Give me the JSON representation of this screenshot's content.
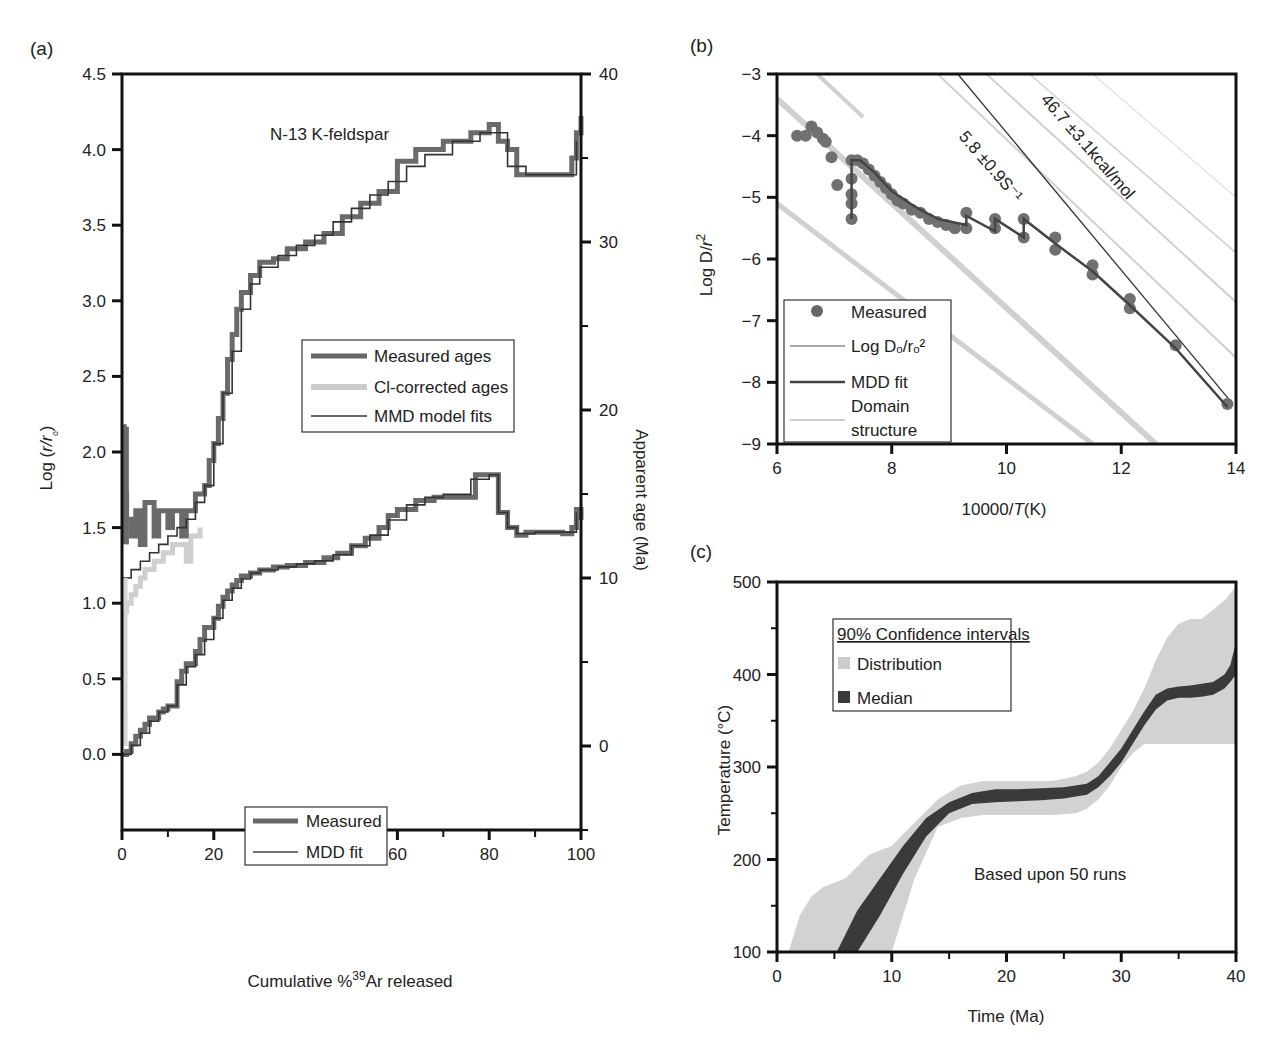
{
  "figure": {
    "panels": [
      "(a)",
      "(b)",
      "(c)"
    ]
  },
  "chart_data": [
    {
      "id": "a",
      "type": "line",
      "panel_label": "(a)",
      "title": "N-13 K-feldspar",
      "xlabel": "Cumulative %39Ar released",
      "xlabel_parts": {
        "pre": "Cumulative %",
        "sup": "39",
        "post": "Ar released"
      },
      "ylabel_left": "Log (r/rₒ)",
      "ylabel_left_parts": {
        "pre": "Log (",
        "ital": "r/r",
        "sub": "ₒ",
        "post": ")"
      },
      "ylabel_right": "Apparent age (Ma)",
      "xlim": [
        0,
        100
      ],
      "ylim_left": [
        -0.5,
        4.5
      ],
      "ylim_right": [
        -5,
        40
      ],
      "xticks": [
        "0",
        "20",
        "40",
        "60",
        "80",
        "100"
      ],
      "yticks_left": [
        "0.0",
        "0.5",
        "1.0",
        "1.5",
        "2.0",
        "2.5",
        "3.0",
        "3.5",
        "4.0",
        "4.5"
      ],
      "yticks_right": [
        "0",
        "10",
        "20",
        "30",
        "40"
      ],
      "legend_ages": [
        "Measured ages",
        "Cl-corrected ages",
        "MMD model fits"
      ],
      "legend_logr": [
        "Measured",
        "MDD fit"
      ],
      "series": [
        {
          "name": "Measured ages",
          "axis": "right",
          "style": "thick-dark",
          "x": [
            0,
            0.5,
            1,
            2,
            3,
            4,
            5,
            7,
            8,
            10,
            11,
            13,
            14,
            16,
            18,
            19,
            20,
            21,
            22,
            23,
            24,
            25,
            26,
            28,
            30,
            33,
            36,
            40,
            44,
            48,
            52,
            56,
            60,
            64,
            70,
            76,
            80,
            82,
            84,
            86,
            90,
            94,
            97,
            98,
            99,
            100
          ],
          "y": [
            19,
            15,
            13.5,
            12.5,
            14,
            12,
            14.5,
            12.5,
            14,
            13,
            14,
            12.5,
            14,
            15,
            15.5,
            17,
            18,
            19.5,
            21,
            23,
            24.5,
            26,
            27,
            28,
            28.8,
            29,
            29.6,
            30,
            30.5,
            31.5,
            32.3,
            33,
            34.8,
            35.5,
            36,
            36.5,
            37,
            36,
            35.5,
            34,
            34,
            34,
            34,
            35,
            36.5,
            37.5
          ]
        },
        {
          "name": "Cl-corrected ages",
          "axis": "right",
          "style": "thick-light",
          "x": [
            0,
            0.5,
            1,
            2,
            3,
            4,
            5,
            7,
            9,
            11,
            13,
            14,
            15,
            17
          ],
          "y": [
            2,
            8,
            8.5,
            9,
            9.5,
            10,
            10.5,
            11,
            11.5,
            12,
            12,
            11,
            12.5,
            13
          ]
        },
        {
          "name": "MMD model fits",
          "axis": "right",
          "style": "thin-dark",
          "x": [
            0,
            2,
            4,
            6,
            8,
            10,
            12,
            14,
            16,
            18,
            20,
            22,
            24,
            26,
            28,
            30,
            34,
            38,
            42,
            46,
            50,
            54,
            58,
            62,
            66,
            72,
            78,
            84,
            88,
            92,
            96,
            99
          ],
          "y": [
            10,
            10.5,
            11,
            11.5,
            12,
            12.5,
            13,
            13.5,
            14.5,
            15.5,
            18,
            21,
            23.5,
            26,
            27.5,
            28.5,
            29.2,
            29.8,
            30.4,
            31.2,
            32,
            32.8,
            33.6,
            34.5,
            35.2,
            36,
            36.5,
            34.5,
            34,
            34,
            34,
            36
          ]
        },
        {
          "name": "Measured",
          "axis": "left",
          "style": "thick-dark",
          "x": [
            0,
            1,
            2,
            3,
            4,
            5,
            6,
            8,
            9,
            10,
            12,
            13,
            14,
            16,
            17,
            18,
            20,
            21,
            22,
            23,
            24,
            25,
            26,
            28,
            30,
            33,
            36,
            40,
            44,
            47,
            50,
            53,
            56,
            58,
            60,
            64,
            68,
            72,
            77,
            80,
            82,
            84,
            86,
            88,
            92,
            96,
            98,
            99,
            100
          ],
          "y": [
            0.0,
            0.02,
            0.07,
            0.12,
            0.16,
            0.2,
            0.24,
            0.28,
            0.3,
            0.32,
            0.48,
            0.55,
            0.6,
            0.68,
            0.76,
            0.84,
            0.9,
            0.98,
            1.04,
            1.08,
            1.12,
            1.15,
            1.18,
            1.2,
            1.22,
            1.24,
            1.25,
            1.27,
            1.3,
            1.33,
            1.38,
            1.43,
            1.5,
            1.58,
            1.62,
            1.68,
            1.7,
            1.7,
            1.85,
            1.85,
            1.6,
            1.5,
            1.45,
            1.47,
            1.47,
            1.46,
            1.5,
            1.62,
            1.55
          ]
        },
        {
          "name": "MDD fit",
          "axis": "left",
          "style": "thin-dark",
          "x": [
            0,
            2,
            4,
            6,
            8,
            10,
            12,
            14,
            16,
            18,
            20,
            22,
            24,
            26,
            28,
            30,
            34,
            38,
            42,
            46,
            50,
            54,
            58,
            62,
            66,
            70,
            76,
            80,
            82,
            84,
            86,
            90,
            96,
            99
          ],
          "y": [
            0.0,
            0.06,
            0.14,
            0.22,
            0.28,
            0.32,
            0.46,
            0.58,
            0.66,
            0.76,
            0.9,
            1.02,
            1.1,
            1.16,
            1.2,
            1.22,
            1.24,
            1.26,
            1.28,
            1.32,
            1.38,
            1.45,
            1.55,
            1.65,
            1.7,
            1.72,
            1.82,
            1.85,
            1.6,
            1.5,
            1.46,
            1.47,
            1.47,
            1.6
          ]
        }
      ]
    },
    {
      "id": "b",
      "type": "scatter",
      "panel_label": "(b)",
      "xlabel": "10000/T(K)",
      "xlabel_parts": {
        "pre": "10000/",
        "ital": "T",
        "post": "(K)"
      },
      "ylabel": "Log D/r²",
      "ylabel_parts": {
        "pre": "Log D/",
        "ital": "r",
        "sup": "2"
      },
      "xlim": [
        6,
        14
      ],
      "ylim": [
        -9,
        -3
      ],
      "xticks": [
        "6",
        "8",
        "10",
        "12",
        "14"
      ],
      "yticks": [
        "−9",
        "−8",
        "−7",
        "−6",
        "−5",
        "−4",
        "−3"
      ],
      "annotations": [
        "46.7 ±3.1kcal/mol",
        "5.8 ±0.9S⁻¹"
      ],
      "legend": [
        "Measured",
        "Log Dₒ/rₒ²",
        "MDD fit",
        "Domain structure"
      ],
      "legend_domain_lines": [
        "Domain",
        "structure"
      ],
      "series": [
        {
          "name": "Measured",
          "style": "dots",
          "x": [
            6.35,
            6.5,
            6.6,
            6.7,
            6.8,
            6.85,
            6.95,
            7.05,
            7.3,
            7.3,
            7.3,
            7.3,
            7.3,
            7.4,
            7.5,
            7.6,
            7.7,
            7.8,
            7.9,
            8.0,
            8.1,
            8.2,
            8.35,
            8.5,
            8.65,
            8.8,
            8.95,
            9.1,
            9.3,
            9.3,
            9.8,
            9.8,
            10.3,
            10.3,
            10.85,
            10.85,
            11.5,
            11.5,
            12.15,
            12.15,
            12.95,
            13.85
          ],
          "y": [
            -4.0,
            -4.0,
            -3.85,
            -3.95,
            -4.05,
            -4.1,
            -4.35,
            -4.8,
            -4.4,
            -4.7,
            -4.95,
            -5.1,
            -5.35,
            -4.4,
            -4.45,
            -4.55,
            -4.65,
            -4.75,
            -4.85,
            -4.95,
            -5.05,
            -5.1,
            -5.2,
            -5.25,
            -5.35,
            -5.4,
            -5.45,
            -5.5,
            -5.25,
            -5.5,
            -5.35,
            -5.5,
            -5.35,
            -5.65,
            -5.65,
            -5.85,
            -6.1,
            -6.25,
            -6.65,
            -6.8,
            -7.4,
            -8.35
          ]
        },
        {
          "name": "MDD fit",
          "style": "thick-line",
          "x": [
            7.3,
            7.3,
            7.45,
            7.7,
            8.0,
            8.4,
            8.8,
            9.3,
            9.3,
            9.8,
            9.8,
            10.3,
            10.3,
            10.85,
            11.5,
            12.15,
            12.95,
            13.85
          ],
          "y": [
            -5.35,
            -4.4,
            -4.4,
            -4.6,
            -4.9,
            -5.15,
            -5.35,
            -5.45,
            -5.3,
            -5.55,
            -5.35,
            -5.65,
            -5.35,
            -5.75,
            -6.2,
            -6.75,
            -7.45,
            -8.4
          ]
        },
        {
          "name": "Log Do/ro2",
          "style": "thin-line",
          "x": [
            9.15,
            13.9
          ],
          "y": [
            -3.0,
            -8.3
          ]
        },
        {
          "name": "Domain structure",
          "style": "light-lines",
          "lines": [
            {
              "x": [
                6.0,
                11.5
              ],
              "y": [
                -5.1,
                -9.0
              ],
              "width": 5
            },
            {
              "x": [
                6.0,
                12.6
              ],
              "y": [
                -3.4,
                -9.0
              ],
              "width": 6
            },
            {
              "x": [
                6.7,
                7.5
              ],
              "y": [
                -3.0,
                -3.7
              ],
              "width": 4
            },
            {
              "x": [
                8.8,
                14.0
              ],
              "y": [
                -3.0,
                -7.6
              ],
              "width": 2
            },
            {
              "x": [
                9.65,
                14.0
              ],
              "y": [
                -3.0,
                -6.7
              ],
              "width": 2
            },
            {
              "x": [
                10.4,
                14.0
              ],
              "y": [
                -3.0,
                -5.9
              ],
              "width": 1.5
            },
            {
              "x": [
                11.5,
                14.0
              ],
              "y": [
                -3.0,
                -5.0
              ],
              "width": 1
            }
          ]
        }
      ]
    },
    {
      "id": "c",
      "type": "area",
      "panel_label": "(c)",
      "xlabel": "Time (Ma)",
      "ylabel": "Temperature (°C)",
      "xlim": [
        0,
        40
      ],
      "ylim": [
        100,
        500
      ],
      "xticks": [
        "0",
        "10",
        "20",
        "30",
        "40"
      ],
      "yticks": [
        "100",
        "200",
        "300",
        "400",
        "500"
      ],
      "legend_title": "90% Confidence intervals",
      "legend": [
        "Distribution",
        "Median"
      ],
      "annotation": "Based upon 50 runs",
      "series": [
        {
          "name": "Distribution",
          "x": [
            1,
            2,
            3,
            4,
            5,
            6,
            8,
            10,
            12,
            14,
            16,
            18,
            20,
            22,
            24,
            26,
            27,
            28,
            29,
            30,
            31,
            32,
            33,
            34,
            35,
            36,
            37,
            38,
            39,
            40
          ],
          "upper": [
            100,
            140,
            160,
            170,
            175,
            180,
            205,
            215,
            240,
            265,
            280,
            285,
            285,
            285,
            285,
            290,
            295,
            305,
            320,
            340,
            360,
            385,
            415,
            440,
            455,
            460,
            460,
            470,
            480,
            495
          ],
          "lower": [
            100,
            100,
            100,
            100,
            100,
            100,
            100,
            100,
            180,
            235,
            245,
            248,
            248,
            248,
            248,
            250,
            255,
            265,
            280,
            300,
            315,
            325,
            325,
            325,
            325,
            325,
            325,
            325,
            325,
            325
          ]
        },
        {
          "name": "Median",
          "x": [
            5.2,
            7,
            9,
            11,
            13,
            15,
            17,
            19,
            21,
            23,
            25,
            27,
            28,
            29,
            30,
            31,
            32,
            33,
            34,
            35,
            36,
            37,
            38,
            39,
            39.5,
            40
          ],
          "upper": [
            100,
            145,
            180,
            215,
            245,
            262,
            272,
            276,
            276,
            277,
            278,
            282,
            290,
            305,
            320,
            340,
            360,
            378,
            385,
            387,
            388,
            390,
            392,
            400,
            410,
            435
          ],
          "lower": [
            100,
            100,
            140,
            185,
            225,
            250,
            260,
            262,
            263,
            264,
            266,
            270,
            278,
            290,
            305,
            325,
            345,
            362,
            372,
            375,
            375,
            376,
            378,
            385,
            392,
            400
          ]
        }
      ]
    }
  ]
}
